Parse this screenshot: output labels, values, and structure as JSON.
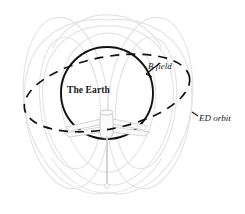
{
  "figure": {
    "type": "diagram",
    "background_color": "#ffffff"
  },
  "labels": {
    "earth": "The Earth",
    "b_field": "B field",
    "ed_orbit": "ED orbit"
  },
  "colors": {
    "outline": "#111111",
    "field_line": "#e2e2e2",
    "satellite_body": "#f2f2f2",
    "satellite_edge": "#c9c9c9",
    "tether": "#cfcfcf",
    "text": "#1a1a1a"
  },
  "geometry": {
    "earth_circle": {
      "cx": 107,
      "cy": 93,
      "r": 46
    },
    "ed_orbit_ellipse": {
      "cx": 107,
      "cy": 93,
      "rx": 84,
      "ry": 36,
      "rotation_deg": -11
    },
    "satellite": {
      "x": 107,
      "y": 124
    },
    "tether": {
      "x": 107,
      "y_top": 137,
      "y_bottom": 186
    }
  },
  "elements": {
    "earth_name": "earth-sphere",
    "orbit_name": "ed-orbit-dashed-ellipse",
    "field_name": "magnetic-field-lines",
    "satellite_name": "ed-tether-satellite"
  }
}
